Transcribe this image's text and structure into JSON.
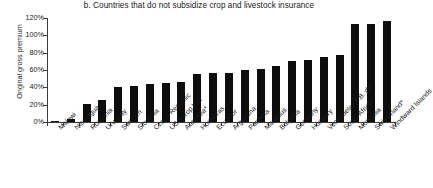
{
  "chart_data": {
    "type": "bar",
    "title": "b. Countries that do not subsidize crop and livestock insurance",
    "xlabel": "",
    "ylabel": "Original gross premium",
    "ylim": [
      0,
      120
    ],
    "ytick_labels": [
      "0%",
      "20%",
      "40%",
      "60%",
      "80%",
      "100%",
      "120%"
    ],
    "ytick_values": [
      0,
      20,
      40,
      60,
      80,
      100,
      120
    ],
    "grid": false,
    "legend": "none",
    "bar_color": "#0d0d0d",
    "categories": [
      "Malawi",
      "Nicaragua",
      "Romania",
      "Uruguay",
      "Sweden",
      "Slovenia",
      "Czech Republic",
      "USA crop hail",
      "Australia*",
      "Honduras",
      "Ecuador",
      "Argentina",
      "Panama",
      "Mauritius",
      "Bulgaria",
      "Germany",
      "Hungary",
      "Venezuela, R.B. de",
      "South Africa*",
      "Mongolia",
      "Switzerland*",
      "Windward Islands"
    ],
    "values": [
      1,
      3,
      21,
      25,
      40,
      41,
      44,
      45,
      46,
      55,
      56,
      56,
      60,
      61,
      65,
      70,
      72,
      75,
      77,
      113,
      113,
      116
    ]
  }
}
